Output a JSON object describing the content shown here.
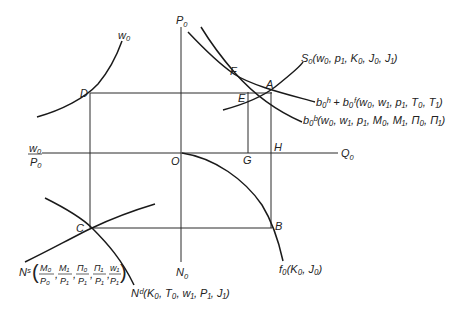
{
  "diagram": {
    "type": "four-quadrant macroeconomic equilibrium diagram",
    "axes": {
      "vertical_top": {
        "label": "P",
        "sub": "0"
      },
      "vertical_bottom": {
        "label": "N",
        "sub": "0"
      },
      "horizontal_right": {
        "label": "Q",
        "sub": "0"
      },
      "horizontal_left": {
        "num": "w",
        "num_sub": "0",
        "den": "P",
        "den_sub": "0"
      },
      "origin": "O"
    },
    "points": {
      "A": "A",
      "B": "B",
      "C": "C",
      "D": "D",
      "E": "E",
      "F": "F",
      "G": "G",
      "H": "H"
    },
    "curves": {
      "w0": {
        "label": "w",
        "sub": "0"
      },
      "supply": {
        "name": "S",
        "sub": "0",
        "args": "(w₀, p₁, K₀, J₀, J₁)"
      },
      "demand_hf": {
        "text": "b₀ʰ + b₀ᶠ(w₀, w₁, p₁, T₀, T₁)"
      },
      "demand_b": {
        "text": "b₀ᵇ(w₀, w₁, p₁, M₀, M₁, Π₀, Π₁)"
      },
      "production": {
        "text": "f₀(K₀, J₀)"
      },
      "labor_demand": {
        "text": "Nᵈ(K₀, T₀, w₁, P₁, J₁)"
      },
      "labor_supply": {
        "prefix": "Nˢ",
        "fractions": [
          {
            "num": "M₀",
            "den": "P₀"
          },
          {
            "num": "M₁",
            "den": "P₁"
          },
          {
            "num": "Π₀",
            "den": "P₁"
          },
          {
            "num": "Π₁",
            "den": "P₁"
          },
          {
            "num": "w₁",
            "den": "P₁"
          }
        ]
      }
    }
  }
}
